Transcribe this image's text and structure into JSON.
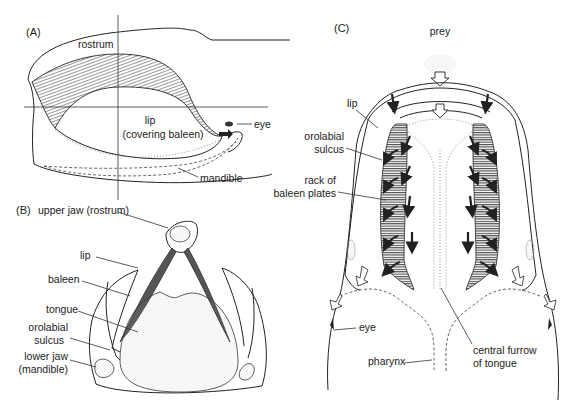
{
  "figure": {
    "panels": [
      {
        "id": "A",
        "label": "(A)",
        "view": "lateral view of whale head",
        "labels": {
          "rostrum": "rostrum",
          "lip_line1": "lip",
          "lip_line2": "(covering baleen)",
          "eye": "eye",
          "mandible": "mandible"
        }
      },
      {
        "id": "B",
        "label": "(B)",
        "view": "cross-section of mouth",
        "labels": {
          "upper_jaw": "upper jaw (rostrum)",
          "lip": "lip",
          "baleen": "baleen",
          "tongue": "tongue",
          "orolabial_line1": "orolabial",
          "orolabial_line2": "sulcus",
          "lower_jaw_line1": "lower jaw",
          "lower_jaw_line2": "(mandible)"
        }
      },
      {
        "id": "C",
        "label": "(C)",
        "view": "dorsal view of water flow through mouth",
        "labels": {
          "prey": "prey",
          "lip": "lip",
          "orolabial_line1": "orolabial",
          "orolabial_line2": "sulcus",
          "rack_line1": "rack of",
          "rack_line2": "baleen plates",
          "eye": "eye",
          "pharynx": "pharynx",
          "furrow_line1": "central furrow",
          "furrow_line2": "of tongue"
        }
      }
    ],
    "colors": {
      "ink": "#222222",
      "hatch": "#444444",
      "stipple": "#bbbbbb",
      "arrow_fill": "#2a2a2a"
    }
  }
}
